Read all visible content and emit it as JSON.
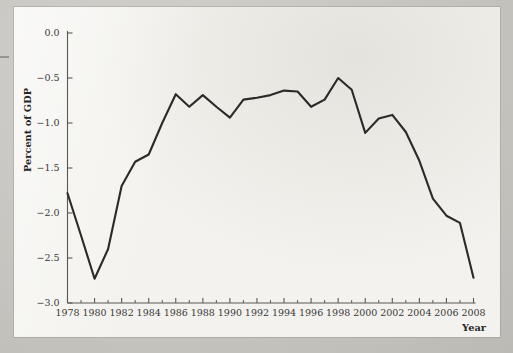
{
  "chart_data": {
    "type": "line",
    "title": "",
    "xlabel": "Year",
    "ylabel": "Percent of GDP",
    "xlim": [
      1978,
      2008
    ],
    "ylim": [
      -3.0,
      0.0
    ],
    "grid": false,
    "legend": null,
    "x_tick_labels": [
      "1978",
      "1980",
      "1982",
      "1984",
      "1986",
      "1988",
      "1990",
      "1992",
      "1994",
      "1996",
      "1998",
      "2000",
      "2002",
      "2004",
      "2006",
      "2008"
    ],
    "x_tick_values": [
      1978,
      1980,
      1982,
      1984,
      1986,
      1988,
      1990,
      1992,
      1994,
      1996,
      1998,
      2000,
      2002,
      2004,
      2006,
      2008
    ],
    "x_minor_tick_values": [
      1979,
      1981,
      1983,
      1985,
      1987,
      1989,
      1991,
      1993,
      1995,
      1997,
      1999,
      2001,
      2003,
      2005,
      2007
    ],
    "y_tick_labels": [
      "0.0",
      "−0.5",
      "−1.0",
      "−1.5",
      "−2.0",
      "−2.5",
      "−3.0"
    ],
    "y_tick_values": [
      0.0,
      -0.5,
      -1.0,
      -1.5,
      -2.0,
      -2.5,
      -3.0
    ],
    "x": [
      1978,
      1979,
      1980,
      1981,
      1982,
      1983,
      1984,
      1985,
      1986,
      1987,
      1988,
      1989,
      1990,
      1991,
      1992,
      1993,
      1994,
      1995,
      1996,
      1997,
      1998,
      1999,
      2000,
      2001,
      2002,
      2003,
      2004,
      2005,
      2006,
      2007,
      2008
    ],
    "values": [
      -1.78,
      -2.25,
      -2.73,
      -2.4,
      -1.7,
      -1.43,
      -1.35,
      -1.0,
      -0.68,
      -0.82,
      -0.69,
      -0.82,
      -0.94,
      -0.74,
      -0.72,
      -0.69,
      -0.64,
      -0.65,
      -0.82,
      -0.74,
      -0.5,
      -0.63,
      -1.11,
      -0.95,
      -0.91,
      -1.1,
      -1.42,
      -1.84,
      -2.03,
      -2.11,
      -2.72
    ],
    "series": [
      {
        "name": "Percent of GDP",
        "color": "#2b2a28",
        "values": [
          -1.78,
          -2.25,
          -2.73,
          -2.4,
          -1.7,
          -1.43,
          -1.35,
          -1.0,
          -0.68,
          -0.82,
          -0.69,
          -0.82,
          -0.94,
          -0.74,
          -0.72,
          -0.69,
          -0.64,
          -0.65,
          -0.82,
          -0.74,
          -0.5,
          -0.63,
          -1.11,
          -0.95,
          -0.91,
          -1.1,
          -1.42,
          -1.84,
          -2.03,
          -2.11,
          -2.72
        ]
      }
    ]
  },
  "colors": {
    "page_background": "#c9c7c2",
    "paper": "#f3f2ee",
    "line": "#2b2a28",
    "axis": "#5a5854",
    "text": "#3a3836"
  }
}
